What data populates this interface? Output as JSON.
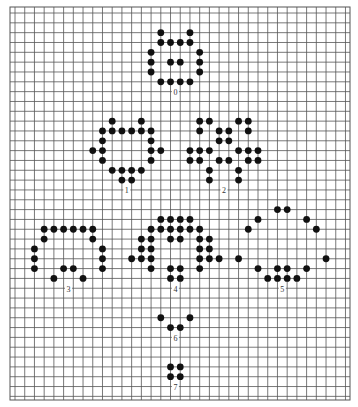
{
  "figure": {
    "grid": {
      "x0": 15,
      "y0": 13,
      "dx": 9.72,
      "dy": 9.83,
      "cols": 35,
      "rows": 40,
      "left": 10,
      "right": 350,
      "top": 7,
      "bottom": 400,
      "line_color": "#555555",
      "dot_color": "#111111",
      "dot_radius": 3.4
    },
    "patterns": [
      {
        "label": "0",
        "label_pos": [
          16.5,
          8.2
        ],
        "dots": [
          [
            15,
            2
          ],
          [
            18,
            2
          ],
          [
            15,
            3
          ],
          [
            16,
            3
          ],
          [
            17,
            3
          ],
          [
            18,
            3
          ],
          [
            14,
            4
          ],
          [
            19,
            4
          ],
          [
            14,
            5
          ],
          [
            16,
            5
          ],
          [
            17,
            5
          ],
          [
            19,
            5
          ],
          [
            14,
            6
          ],
          [
            19,
            6
          ],
          [
            15,
            7
          ],
          [
            16,
            7
          ],
          [
            17,
            7
          ],
          [
            18,
            7
          ]
        ]
      },
      {
        "label": "1",
        "label_pos": [
          11.5,
          18.2
        ],
        "dots": [
          [
            10,
            11
          ],
          [
            13,
            11
          ],
          [
            9,
            12
          ],
          [
            10,
            12
          ],
          [
            11,
            12
          ],
          [
            12,
            12
          ],
          [
            13,
            12
          ],
          [
            14,
            12
          ],
          [
            9,
            13
          ],
          [
            14,
            13
          ],
          [
            8,
            14
          ],
          [
            9,
            14
          ],
          [
            14,
            14
          ],
          [
            15,
            14
          ],
          [
            9,
            15
          ],
          [
            14,
            15
          ],
          [
            10,
            16
          ],
          [
            11,
            16
          ],
          [
            12,
            16
          ],
          [
            13,
            16
          ],
          [
            11,
            17
          ],
          [
            12,
            17
          ]
        ]
      },
      {
        "label": "2",
        "label_pos": [
          21.5,
          18.2
        ],
        "dots": [
          [
            19,
            11
          ],
          [
            20,
            11
          ],
          [
            23,
            11
          ],
          [
            24,
            11
          ],
          [
            19,
            12
          ],
          [
            21,
            12
          ],
          [
            22,
            12
          ],
          [
            24,
            12
          ],
          [
            21,
            13
          ],
          [
            22,
            13
          ],
          [
            18,
            14
          ],
          [
            19,
            14
          ],
          [
            20,
            14
          ],
          [
            23,
            14
          ],
          [
            24,
            14
          ],
          [
            25,
            14
          ],
          [
            18,
            15
          ],
          [
            19,
            15
          ],
          [
            21,
            15
          ],
          [
            22,
            15
          ],
          [
            24,
            15
          ],
          [
            25,
            15
          ],
          [
            20,
            16
          ],
          [
            23,
            16
          ],
          [
            20,
            17
          ],
          [
            23,
            17
          ]
        ]
      },
      {
        "label": "3",
        "label_pos": [
          5.5,
          28.3
        ],
        "dots": [
          [
            3,
            22
          ],
          [
            4,
            22
          ],
          [
            5,
            22
          ],
          [
            6,
            22
          ],
          [
            7,
            22
          ],
          [
            8,
            22
          ],
          [
            3,
            23
          ],
          [
            8,
            23
          ],
          [
            2,
            24
          ],
          [
            9,
            24
          ],
          [
            2,
            25
          ],
          [
            9,
            25
          ],
          [
            2,
            26
          ],
          [
            5,
            26
          ],
          [
            6,
            26
          ],
          [
            9,
            26
          ],
          [
            4,
            27
          ],
          [
            7,
            27
          ]
        ]
      },
      {
        "label": "4",
        "label_pos": [
          16.5,
          28.3
        ],
        "dots": [
          [
            15,
            21
          ],
          [
            16,
            21
          ],
          [
            17,
            21
          ],
          [
            18,
            21
          ],
          [
            14,
            22
          ],
          [
            15,
            22
          ],
          [
            16,
            22
          ],
          [
            17,
            22
          ],
          [
            18,
            22
          ],
          [
            19,
            22
          ],
          [
            13,
            23
          ],
          [
            14,
            23
          ],
          [
            16,
            23
          ],
          [
            17,
            23
          ],
          [
            19,
            23
          ],
          [
            20,
            23
          ],
          [
            13,
            24
          ],
          [
            14,
            24
          ],
          [
            19,
            24
          ],
          [
            20,
            24
          ],
          [
            12,
            25
          ],
          [
            13,
            25
          ],
          [
            14,
            25
          ],
          [
            19,
            25
          ],
          [
            20,
            25
          ],
          [
            21,
            25
          ],
          [
            14,
            26
          ],
          [
            16,
            26
          ],
          [
            17,
            26
          ],
          [
            19,
            26
          ],
          [
            16,
            27
          ],
          [
            17,
            27
          ]
        ]
      },
      {
        "label": "5",
        "label_pos": [
          27.5,
          28.3
        ],
        "dots": [
          [
            27,
            20
          ],
          [
            28,
            20
          ],
          [
            25,
            21
          ],
          [
            30,
            21
          ],
          [
            24,
            22
          ],
          [
            31,
            22
          ],
          [
            23,
            25
          ],
          [
            32,
            25
          ],
          [
            25,
            26
          ],
          [
            27,
            26
          ],
          [
            28,
            26
          ],
          [
            30,
            26
          ],
          [
            26,
            27
          ],
          [
            27,
            27
          ],
          [
            28,
            27
          ],
          [
            29,
            27
          ]
        ]
      },
      {
        "label": "6",
        "label_pos": [
          16.5,
          33.3
        ],
        "dots": [
          [
            15,
            31
          ],
          [
            18,
            31
          ],
          [
            16,
            32
          ],
          [
            17,
            32
          ]
        ]
      },
      {
        "label": "7",
        "label_pos": [
          16.5,
          38.3
        ],
        "dots": [
          [
            16,
            36
          ],
          [
            17,
            36
          ],
          [
            16,
            37
          ],
          [
            17,
            37
          ]
        ]
      }
    ]
  }
}
